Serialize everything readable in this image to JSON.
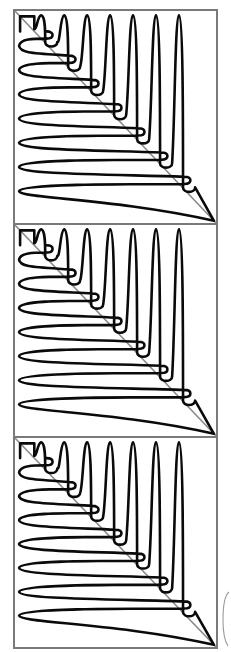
{
  "figure": {
    "panel_count": 3,
    "panels": [
      {
        "label": "panel-1",
        "vertical_loops": 7,
        "horizontal_loops": 7
      },
      {
        "label": "panel-2",
        "vertical_loops": 7,
        "horizontal_loops": 7
      },
      {
        "label": "panel-3",
        "vertical_loops": 7,
        "horizontal_loops": 7
      }
    ],
    "colors": {
      "curve": "#0a0a0a",
      "frame": "#7a7a7a",
      "diagonal": "#8a8a8a",
      "background": "#ffffff"
    }
  }
}
